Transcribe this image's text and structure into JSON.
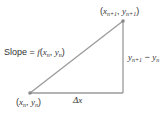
{
  "diagram": {
    "colors": {
      "line": "#9a9a9a",
      "point": "#8a8a8a",
      "text": "#333333"
    },
    "points": {
      "start": {
        "x": 30,
        "y": 93,
        "label": "(x_n, y_n)"
      },
      "end": {
        "x": 123,
        "y": 21,
        "label": "(x_{n+1}, y_{n+1})"
      },
      "corner": {
        "x": 123,
        "y": 93
      }
    },
    "labels": {
      "slope_prefix": "Slope = ",
      "slope_func": "f",
      "dx": "Δx",
      "dy_a": "y",
      "dy_a_sub": "n+1",
      "dy_minus": " − ",
      "dy_b": "y",
      "dy_b_sub": "n",
      "x": "x",
      "y": "y",
      "sub_n": "n",
      "sub_n1": "n+1",
      "open": "(",
      "close": ")",
      "comma": ", "
    }
  }
}
